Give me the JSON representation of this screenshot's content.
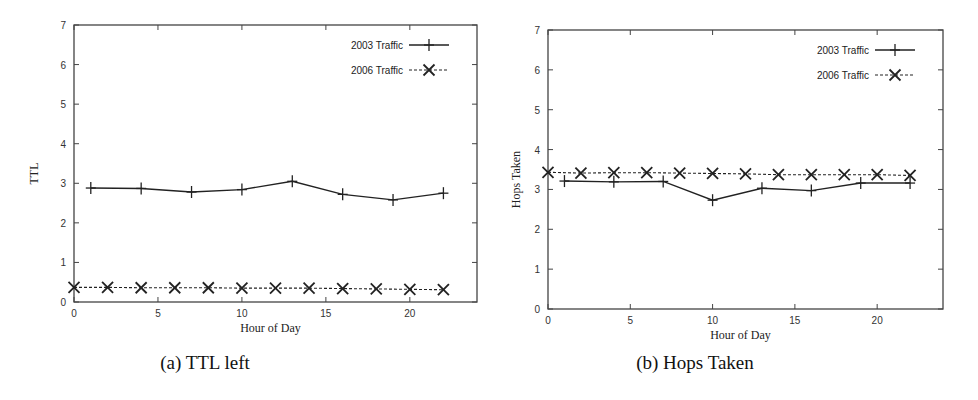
{
  "chart_data": [
    {
      "type": "line",
      "caption": "(a) TTL left",
      "title": "",
      "xlabel": "Hour of Day",
      "ylabel": "TTL",
      "xlim": [
        0,
        24
      ],
      "ylim": [
        0,
        7
      ],
      "xticks": [
        0,
        5,
        10,
        15,
        20
      ],
      "yticks": [
        0,
        1,
        2,
        3,
        4,
        5,
        6,
        7
      ],
      "grid": false,
      "legend_position": "top-right",
      "series": [
        {
          "name": "2003 Traffic",
          "style": "solid",
          "marker": "plus",
          "x": [
            1,
            4,
            7,
            10,
            13,
            16,
            19,
            22
          ],
          "values": [
            2.88,
            2.87,
            2.78,
            2.84,
            3.05,
            2.72,
            2.58,
            2.75
          ]
        },
        {
          "name": "2006 Traffic",
          "style": "dashed",
          "marker": "cross",
          "x": [
            0,
            2,
            4,
            6,
            8,
            10,
            12,
            14,
            16,
            18,
            20,
            22
          ],
          "values": [
            0.37,
            0.37,
            0.36,
            0.36,
            0.36,
            0.35,
            0.35,
            0.35,
            0.34,
            0.33,
            0.32,
            0.31
          ]
        }
      ]
    },
    {
      "type": "line",
      "caption": "(b) Hops Taken",
      "title": "",
      "xlabel": "Hour of Day",
      "ylabel": "Hops Taken",
      "xlim": [
        0,
        24
      ],
      "ylim": [
        0,
        7
      ],
      "xticks": [
        0,
        5,
        10,
        15,
        20
      ],
      "yticks": [
        0,
        1,
        2,
        3,
        4,
        5,
        6,
        7
      ],
      "grid": false,
      "legend_position": "top-right",
      "series": [
        {
          "name": "2003 Traffic",
          "style": "solid",
          "marker": "plus",
          "x": [
            1,
            4,
            7,
            10,
            13,
            16,
            19,
            22
          ],
          "values": [
            3.21,
            3.19,
            3.2,
            2.73,
            3.03,
            2.97,
            3.16,
            3.16
          ]
        },
        {
          "name": "2006 Traffic",
          "style": "dashed",
          "marker": "cross",
          "x": [
            0,
            2,
            4,
            6,
            8,
            10,
            12,
            14,
            16,
            18,
            20,
            22
          ],
          "values": [
            3.43,
            3.41,
            3.42,
            3.42,
            3.41,
            3.4,
            3.39,
            3.37,
            3.37,
            3.37,
            3.37,
            3.35
          ]
        }
      ]
    }
  ],
  "colors": {
    "line": "#222222",
    "frame": "#444444",
    "background": "#ffffff"
  }
}
